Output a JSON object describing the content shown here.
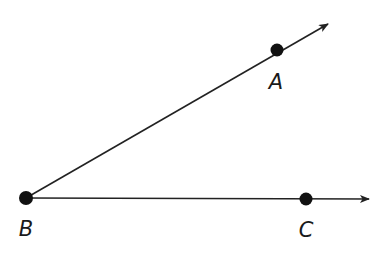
{
  "diagram": {
    "stroke_color": "#222222",
    "point_color": "#111111",
    "vertex": {
      "name": "B",
      "label": "B",
      "x": 26,
      "y": 198,
      "label_x": 26,
      "label_y": 229
    },
    "points": [
      {
        "name": "A",
        "label": "A",
        "x": 277,
        "y": 50,
        "label_x": 276,
        "label_y": 82
      },
      {
        "name": "C",
        "label": "C",
        "x": 306,
        "y": 199,
        "label_x": 306,
        "label_y": 230
      }
    ],
    "rays": [
      {
        "name": "ray-BA",
        "from": "B",
        "through": "A",
        "x1": 26,
        "y1": 198,
        "x2": 328,
        "y2": 24
      },
      {
        "name": "ray-BC",
        "from": "B",
        "through": "C",
        "x1": 26,
        "y1": 198,
        "x2": 369,
        "y2": 199
      }
    ]
  }
}
